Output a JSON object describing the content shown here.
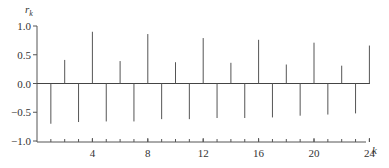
{
  "chart_data": {
    "type": "bar",
    "style": "stem",
    "title": "",
    "xlabel": "k",
    "ylabel": "r_k",
    "x": [
      1,
      2,
      3,
      4,
      5,
      6,
      7,
      8,
      9,
      10,
      11,
      12,
      13,
      14,
      15,
      16,
      17,
      18,
      19,
      20,
      21,
      22,
      23,
      24
    ],
    "values": [
      -0.7,
      0.41,
      -0.67,
      0.9,
      -0.66,
      0.39,
      -0.66,
      0.86,
      -0.62,
      0.37,
      -0.62,
      0.79,
      -0.6,
      0.36,
      -0.6,
      0.76,
      -0.59,
      0.33,
      -0.56,
      0.71,
      -0.54,
      0.31,
      -0.52,
      0.66
    ],
    "ylim": [
      -1.0,
      1.0
    ],
    "xlim": [
      0,
      25
    ],
    "yticks": [
      "1.0",
      "0.5",
      "0.0",
      "-0.5",
      "-1.0"
    ],
    "ytick_values": [
      1.0,
      0.5,
      0.0,
      -0.5,
      -1.0
    ],
    "xticks": [
      "4",
      "8",
      "12",
      "16",
      "20",
      "24"
    ],
    "xtick_values": [
      4,
      8,
      12,
      16,
      20,
      24
    ],
    "grid": false,
    "legend": null
  },
  "labels": {
    "y_axis_label": "r",
    "y_axis_sub": "k",
    "x_axis_label": "k"
  }
}
